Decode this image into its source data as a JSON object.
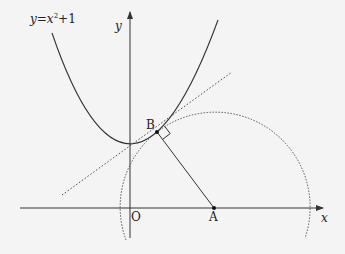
{
  "diagram": {
    "curve_label": {
      "lhs": "y",
      "eq": "=",
      "var": "x",
      "exp": "2",
      "tail": "+1"
    },
    "axes": {
      "x_label": "x",
      "y_label": "y",
      "origin_label": "O"
    },
    "points": {
      "A": {
        "label": "A"
      },
      "B": {
        "label": "B"
      }
    },
    "elements": [
      "parabola y=x^2+1",
      "tangent line at B (dotted)",
      "segment AB",
      "right-angle mark at B",
      "circle centered at A through B (dotted)"
    ],
    "colors": {
      "stroke": "#333333",
      "background": "#f4f4f4"
    }
  }
}
